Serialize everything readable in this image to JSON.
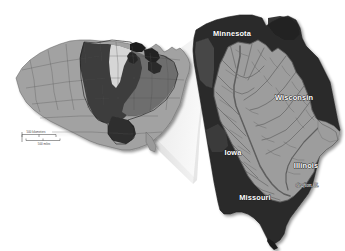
{
  "figure": {
    "background_color": "#ffffff",
    "width": 345,
    "height": 251
  },
  "palette": {
    "state_dark": "#2b2b2b",
    "state_dark_alt": "#3a3a3a",
    "basin_gray": "#9b9b9b",
    "basin_gray_light": "#ababab",
    "river_line": "#6f6f6f",
    "us_light_gray": "#9e9e9e",
    "us_mid_gray": "#7c7c7c",
    "us_dark_gray": "#4a4a4a",
    "us_darkest": "#2f2f2f",
    "lake_dark": "#1c1c1c",
    "wedge_light": "#f0f0f0",
    "wedge_shade": "#cfcfcf",
    "label_text": "#ffffff",
    "scale_text": "#4a4a4a",
    "drop_shadow": "#bdbdbd"
  },
  "overview_map": {
    "name": "united-states-overview",
    "description": "Contiguous United States with Mississippi River basin shaded",
    "scale_bar": {
      "kilometers_label": "500 kilometers",
      "miles_label": "500 miles"
    }
  },
  "detail_map": {
    "name": "upper-mississippi-basin-detail",
    "description": "Upper Mississippi River Basin states with river network",
    "state_labels": [
      {
        "id": "minnesota",
        "text": "Minnesota",
        "x": 232,
        "y": 36
      },
      {
        "id": "wisconsin",
        "text": "Wisconsin",
        "x": 294,
        "y": 100
      },
      {
        "id": "iowa",
        "text": "Iowa",
        "x": 233,
        "y": 155
      },
      {
        "id": "illinois",
        "text": "Illinois",
        "x": 306,
        "y": 168
      },
      {
        "id": "missouri",
        "text": "Missouri",
        "x": 255,
        "y": 200
      }
    ],
    "city_labels": [
      {
        "id": "grafton-il",
        "text": "Grafton, IL",
        "x": 307,
        "y": 187
      }
    ]
  }
}
